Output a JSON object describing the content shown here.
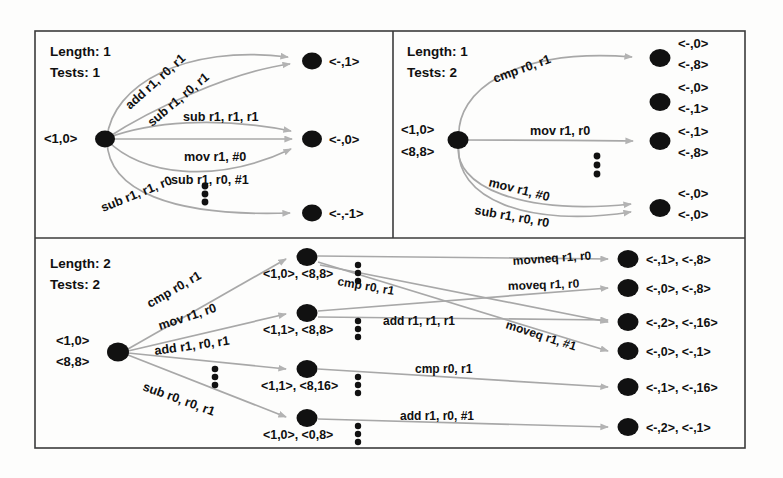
{
  "figure": {
    "background": "#fdfdfc",
    "node_color": "#111111",
    "edge_color": "#a8a8a8",
    "frame_color": "#3b3b3b"
  },
  "panels": [
    {
      "id": "panel-top-left",
      "length_label": "Length: 1",
      "tests_label": "Tests: 1",
      "start_states": [
        "<1,0>"
      ],
      "edges": [
        {
          "label": "add r1, r0, r1",
          "target": 0
        },
        {
          "label": "sub r1, r0, r1",
          "target": 0
        },
        {
          "label": "sub r1, r1, r1",
          "target": 1
        },
        {
          "label": "mov r1, #0",
          "target": 1
        },
        {
          "label": "sub r1, r0, #1",
          "target": 1
        },
        {
          "label": "sub r1, r1, r0",
          "target": 2
        }
      ],
      "result_nodes": [
        {
          "labels": [
            "<-,1>"
          ]
        },
        {
          "labels": [
            "<-,0>"
          ]
        },
        {
          "labels": [
            "<-,-1>"
          ]
        }
      ],
      "ellipsis": 1
    },
    {
      "id": "panel-top-right",
      "length_label": "Length: 1",
      "tests_label": "Tests: 2",
      "start_states": [
        "<1,0>",
        "<8,8>"
      ],
      "edges": [
        {
          "label": "cmp r0, r1",
          "target": 0
        },
        {
          "label": "mov r1, r0",
          "target": 2
        },
        {
          "label": "mov r1, #0",
          "target": 3
        },
        {
          "label": "sub r1, r0, r0",
          "target": 3
        }
      ],
      "result_nodes": [
        {
          "labels": [
            "<-,0>",
            "<-,8>"
          ]
        },
        {
          "labels": [
            "<-,0>",
            "<-,1>"
          ]
        },
        {
          "labels": [
            "<-,1>",
            "<-,8>"
          ]
        },
        {
          "labels": [
            "<-,0>",
            "<-,0>"
          ]
        }
      ],
      "ellipsis": 1
    },
    {
      "id": "panel-bottom",
      "length_label": "Length: 2",
      "tests_label": "Tests: 2",
      "start_states": [
        "<1,0>",
        "<8,8>"
      ],
      "first_edges": [
        {
          "label": "cmp r0, r1",
          "target": 0
        },
        {
          "label": "mov r1, r0",
          "target": 1
        },
        {
          "label": "add r1, r0, r1",
          "target": 2
        },
        {
          "label": "sub r0, r0, r1",
          "target": 3
        }
      ],
      "mid_nodes": [
        {
          "labels": "<1,0>, <8,8>"
        },
        {
          "labels": "<1,1>, <8,8>"
        },
        {
          "labels": "<1,1>, <8,16>"
        },
        {
          "labels": "<1,0>, <0,8>"
        }
      ],
      "second_edges": [
        {
          "label": "movneq r1, r0",
          "from": 0,
          "to": 0
        },
        {
          "label": "cmp r0, r1",
          "from": 0,
          "to": 3
        },
        {
          "label": "moveq r1, r0",
          "from": 1,
          "to": 1
        },
        {
          "label": "add r1, r1, r1",
          "from": 1,
          "to": 2
        },
        {
          "label": "moveq r1, #1",
          "from": 0,
          "to": 3
        },
        {
          "label": "cmp r0, r1",
          "from": 2,
          "to": 4
        },
        {
          "label": "add r1, r0, #1",
          "from": 3,
          "to": 5
        }
      ],
      "result_nodes": [
        {
          "labels": "<-,1>, <-,8>"
        },
        {
          "labels": "<-,0>, <-,8>"
        },
        {
          "labels": "<-,2>, <-,16>"
        },
        {
          "labels": "<-,0>, <-,1>"
        },
        {
          "labels": "<-,1>, <-,16>"
        },
        {
          "labels": "<-,2>, <-,1>"
        }
      ],
      "ellipsis_count": 5
    }
  ]
}
